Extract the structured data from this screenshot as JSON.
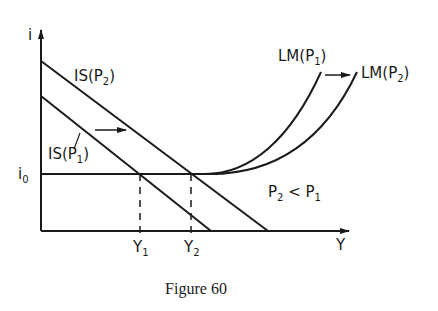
{
  "figure": {
    "caption": "Figure 60",
    "axes": {
      "y_label": "i",
      "x_label": "Y",
      "i0_label": "i",
      "i0_sub": "0"
    },
    "curves": {
      "is_p2": {
        "main": "IS(P",
        "sub": "2",
        "close": ")"
      },
      "is_p1": {
        "main": "IS(P",
        "sub": "1",
        "close": ")"
      },
      "lm_p1": {
        "main": "LM(P",
        "sub": "1",
        "close": ")"
      },
      "lm_p2": {
        "main": "LM(P",
        "sub": "2",
        "close": ")"
      }
    },
    "ticks": {
      "y1": {
        "main": "Y",
        "sub": "1"
      },
      "y2": {
        "main": "Y",
        "sub": "2"
      }
    },
    "condition": {
      "a": "P",
      "a_sub": "2",
      "op": " < ",
      "b": "P",
      "b_sub": "1"
    },
    "colors": {
      "ink": "#1a1a1a",
      "background": "#ffffff"
    }
  }
}
